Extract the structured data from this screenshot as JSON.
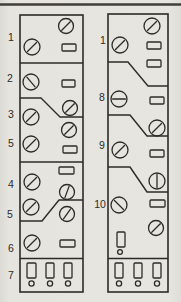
{
  "figure": {
    "kind": "scanned-control-panel-line-diagram",
    "paper_color": "#e6e5e0",
    "ink_color": "#2d2b27",
    "top_rule": {
      "x1": 0,
      "y1": 4.5,
      "x2": 181,
      "y2": 4.5
    }
  },
  "panels": [
    {
      "name": "left-panel",
      "frame": {
        "x": 20,
        "y": 15,
        "w": 63,
        "h": 277
      },
      "labels": [
        {
          "text": "1",
          "x": 11,
          "y": 41
        },
        {
          "text": "2",
          "x": 10,
          "y": 82
        },
        {
          "text": "3",
          "x": 11,
          "y": 118
        },
        {
          "text": "5",
          "x": 11,
          "y": 147
        },
        {
          "text": "4",
          "x": 11,
          "y": 188
        },
        {
          "text": "5",
          "x": 10,
          "y": 218
        },
        {
          "text": "6",
          "x": 11,
          "y": 252
        },
        {
          "text": "7",
          "x": 11,
          "y": 279
        }
      ],
      "dividers": [
        {
          "points": "20,63 83,63"
        },
        {
          "points": "20,98 41,98 60,117 83,117"
        },
        {
          "points": "20,162 83,162"
        },
        {
          "points": "20,221 42,221 59,200 83,200"
        },
        {
          "points": "20,258.5 83,258.5"
        }
      ],
      "knobs": [
        {
          "cx": 66,
          "cy": 26,
          "r": 7.5,
          "angle": 45
        },
        {
          "cx": 32,
          "cy": 47,
          "r": 8,
          "angle": 45
        },
        {
          "cx": 31,
          "cy": 82,
          "r": 8,
          "angle": 130
        },
        {
          "cx": 31,
          "cy": 117,
          "r": 8,
          "angle": 45
        },
        {
          "cx": 70,
          "cy": 108,
          "r": 7.5,
          "angle": 45
        },
        {
          "cx": 69,
          "cy": 130,
          "r": 7.5,
          "angle": 45
        },
        {
          "cx": 31,
          "cy": 144,
          "r": 8,
          "angle": 45
        },
        {
          "cx": 32,
          "cy": 182,
          "r": 8,
          "angle": 45
        },
        {
          "cx": 67,
          "cy": 192,
          "r": 7.5,
          "angle": 70
        },
        {
          "cx": 31,
          "cy": 207,
          "r": 8,
          "angle": 45
        },
        {
          "cx": 67,
          "cy": 214,
          "r": 7.5,
          "angle": 55
        },
        {
          "cx": 32,
          "cy": 243,
          "r": 8,
          "angle": 45
        }
      ],
      "rects": [
        {
          "x": 62,
          "y": 44,
          "w": 14,
          "h": 7
        },
        {
          "x": 62,
          "y": 80,
          "w": 13,
          "h": 7
        },
        {
          "x": 63,
          "y": 146,
          "w": 14,
          "h": 7
        },
        {
          "x": 59,
          "y": 167,
          "w": 15,
          "h": 7
        },
        {
          "x": 60,
          "y": 240,
          "w": 15,
          "h": 7
        }
      ],
      "slots": [
        {
          "x": 27,
          "y": 263,
          "w": 9,
          "h": 15
        },
        {
          "x": 46,
          "y": 263,
          "w": 8,
          "h": 15
        },
        {
          "x": 64,
          "y": 263,
          "w": 8,
          "h": 15
        }
      ],
      "dots": [
        {
          "cx": 31.5,
          "cy": 283.5,
          "r": 2.6
        },
        {
          "cx": 50,
          "cy": 283.5,
          "r": 2.6
        },
        {
          "cx": 68,
          "cy": 283.5,
          "r": 2.6
        }
      ]
    },
    {
      "name": "right-panel",
      "frame": {
        "x": 108,
        "y": 14,
        "w": 60,
        "h": 278
      },
      "labels": [
        {
          "text": "1",
          "x": 103,
          "y": 44
        },
        {
          "text": "8",
          "x": 102,
          "y": 100.5
        },
        {
          "text": "9",
          "x": 102,
          "y": 149
        },
        {
          "text": "10",
          "x": 100,
          "y": 207.5
        }
      ],
      "dividers": [
        {
          "points": "108,62 128,62 148,86 168,86"
        },
        {
          "points": "108,115 130,115 147,136 168,136"
        },
        {
          "points": "108,167 130,167 147,192 168,192"
        },
        {
          "points": "108,258.5 168,258.5"
        }
      ],
      "knobs": [
        {
          "cx": 152,
          "cy": 26,
          "r": 8,
          "angle": 45
        },
        {
          "cx": 120,
          "cy": 45,
          "r": 8,
          "angle": 45
        },
        {
          "cx": 119,
          "cy": 99,
          "r": 8,
          "angle": 0
        },
        {
          "cx": 157,
          "cy": 128,
          "r": 8,
          "angle": 45
        },
        {
          "cx": 120,
          "cy": 150,
          "r": 8,
          "angle": 45
        },
        {
          "cx": 157,
          "cy": 181,
          "r": 8,
          "angle": 90
        },
        {
          "cx": 119,
          "cy": 205,
          "r": 8,
          "angle": 135
        },
        {
          "cx": 156,
          "cy": 228,
          "r": 7.5,
          "angle": 45
        }
      ],
      "rects": [
        {
          "x": 147,
          "y": 42,
          "w": 14,
          "h": 7
        },
        {
          "x": 147,
          "y": 60,
          "w": 14,
          "h": 7
        },
        {
          "x": 150,
          "y": 97,
          "w": 14,
          "h": 7
        },
        {
          "x": 150,
          "y": 150,
          "w": 14,
          "h": 7
        },
        {
          "x": 150,
          "y": 200,
          "w": 15,
          "h": 7
        }
      ],
      "slots": [
        {
          "x": 117,
          "y": 232,
          "w": 8,
          "h": 15
        },
        {
          "x": 115,
          "y": 263,
          "w": 8,
          "h": 15
        },
        {
          "x": 134,
          "y": 263,
          "w": 8,
          "h": 15
        },
        {
          "x": 153,
          "y": 263,
          "w": 8,
          "h": 15
        }
      ],
      "dots": [
        {
          "cx": 120,
          "cy": 252,
          "r": 2.4
        },
        {
          "cx": 119,
          "cy": 283.5,
          "r": 2.6
        },
        {
          "cx": 138,
          "cy": 283.5,
          "r": 2.6
        },
        {
          "cx": 157,
          "cy": 283.5,
          "r": 2.6
        }
      ]
    }
  ]
}
